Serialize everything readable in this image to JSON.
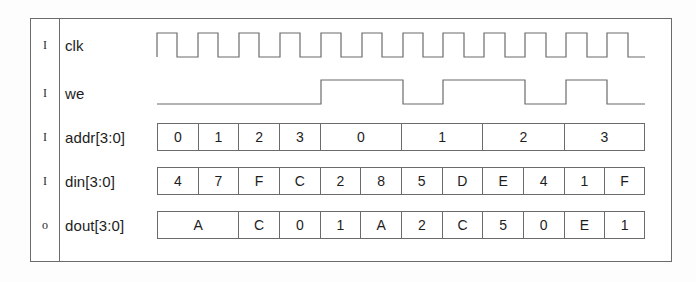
{
  "diagram": {
    "line_color": "#6b6b6b",
    "text_color": "#1d1d1d",
    "cycles": 12
  },
  "signals": [
    {
      "direction": "I",
      "name": "clk",
      "kind": "clock",
      "pattern": "12 full cycles, starts high",
      "values": [
        1,
        0,
        1,
        0,
        1,
        0,
        1,
        0,
        1,
        0,
        1,
        0,
        1,
        0,
        1,
        0,
        1,
        0,
        1,
        0,
        1,
        0,
        1,
        0
      ]
    },
    {
      "direction": "I",
      "name": "we",
      "kind": "binary",
      "pattern": "low for 4 cycles then high/low alternating pairs",
      "values": [
        0,
        0,
        0,
        0,
        1,
        1,
        0,
        0,
        1,
        1,
        0,
        0,
        1,
        1,
        0,
        0,
        1,
        1,
        0
      ]
    },
    {
      "direction": "I",
      "name": "addr[3:0]",
      "kind": "bus",
      "cells": [
        {
          "label": "0",
          "span": 1
        },
        {
          "label": "1",
          "span": 1
        },
        {
          "label": "2",
          "span": 1
        },
        {
          "label": "3",
          "span": 1
        },
        {
          "label": "0",
          "span": 2
        },
        {
          "label": "1",
          "span": 2
        },
        {
          "label": "2",
          "span": 2
        },
        {
          "label": "3",
          "span": 2
        }
      ]
    },
    {
      "direction": "I",
      "name": "din[3:0]",
      "kind": "bus",
      "cells": [
        {
          "label": "4",
          "span": 1
        },
        {
          "label": "7",
          "span": 1
        },
        {
          "label": "F",
          "span": 1
        },
        {
          "label": "C",
          "span": 1
        },
        {
          "label": "2",
          "span": 1
        },
        {
          "label": "8",
          "span": 1
        },
        {
          "label": "5",
          "span": 1
        },
        {
          "label": "D",
          "span": 1
        },
        {
          "label": "E",
          "span": 1
        },
        {
          "label": "4",
          "span": 1
        },
        {
          "label": "1",
          "span": 1
        },
        {
          "label": "F",
          "span": 1
        }
      ]
    },
    {
      "direction": "o",
      "name": "dout[3:0]",
      "kind": "bus",
      "cells": [
        {
          "label": "A",
          "span": 2
        },
        {
          "label": "C",
          "span": 1
        },
        {
          "label": "0",
          "span": 1
        },
        {
          "label": "1",
          "span": 1
        },
        {
          "label": "A",
          "span": 1
        },
        {
          "label": "2",
          "span": 1
        },
        {
          "label": "C",
          "span": 1
        },
        {
          "label": "5",
          "span": 1
        },
        {
          "label": "0",
          "span": 1
        },
        {
          "label": "E",
          "span": 1
        },
        {
          "label": "1",
          "span": 1
        }
      ]
    }
  ]
}
